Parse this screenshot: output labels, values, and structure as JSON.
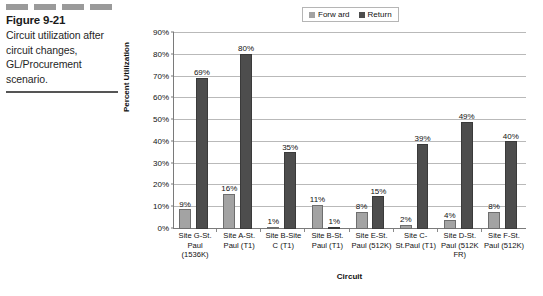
{
  "figure": {
    "number": "Figure 9-21",
    "caption": "Circuit utilization after circuit changes, GL/Procurement scenario."
  },
  "legend": {
    "position": "top",
    "entries": [
      {
        "label": "Forw ard",
        "color": "#a3a3a3",
        "swatch_name": "legend-swatch-forward"
      },
      {
        "label": "Return",
        "color": "#4d4d4d",
        "swatch_name": "legend-swatch-return"
      }
    ]
  },
  "chart_data": {
    "type": "bar",
    "title": "",
    "xlabel": "Circuit",
    "ylabel": "Percent Utilization",
    "ylim": [
      0,
      90
    ],
    "ytick_labels": [
      "90%",
      "80%",
      "70%",
      "60%",
      "50%",
      "40%",
      "30%",
      "20%",
      "10%",
      "0%"
    ],
    "ytick_values": [
      90,
      80,
      70,
      60,
      50,
      40,
      30,
      20,
      10,
      0
    ],
    "grid": true,
    "categories": [
      "Site G-St. Paul (1536K)",
      "Site A-St. Paul (T1)",
      "Site B-Site C (T1)",
      "Site B-St. Paul (T1)",
      "Site E-St. Paul (512K)",
      "Site C-St.Paul (T1)",
      "Site D-St. Paul (512K FR)",
      "Site F-St. Paul (512K)"
    ],
    "series": [
      {
        "name": "Forw ard",
        "color": "#a3a3a3",
        "values": [
          9,
          16,
          1,
          11,
          8,
          2,
          4,
          8
        ],
        "labels": [
          "9%",
          "16%",
          "1%",
          "11%",
          "8%",
          "2%",
          "4%",
          "8%"
        ]
      },
      {
        "name": "Return",
        "color": "#4d4d4d",
        "values": [
          69,
          80,
          35,
          1,
          15,
          39,
          49,
          40
        ],
        "labels": [
          "69%",
          "80%",
          "35%",
          "1%",
          "15%",
          "39%",
          "49%",
          "40%"
        ]
      }
    ]
  }
}
